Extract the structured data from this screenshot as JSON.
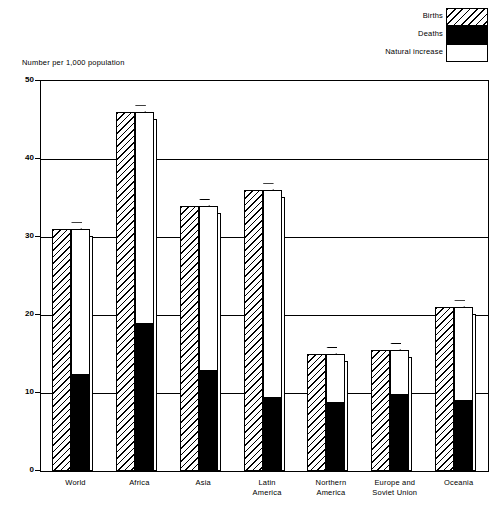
{
  "axis_title": "Number per 1,000 population",
  "legend": [
    {
      "label": "Births",
      "swatch": "hatched-diagonal"
    },
    {
      "label": "Deaths",
      "swatch": "solid-black"
    },
    {
      "label": "Natural increase",
      "swatch": "white"
    }
  ],
  "chart_data": {
    "type": "bar",
    "title": "",
    "subtitle": "",
    "xlabel": "",
    "ylabel": "Number per 1,000 population",
    "ylim": [
      0,
      50
    ],
    "yticks": [
      0,
      10,
      20,
      30,
      40,
      50
    ],
    "grid": true,
    "legend_position": "top-right",
    "categories": [
      "World",
      "Africa",
      "Asia",
      "Latin\nAmerica",
      "Northern\nAmerica",
      "Europe and\nSoviet Union",
      "Oceania"
    ],
    "series": [
      {
        "name": "Births",
        "values": [
          31,
          46,
          34,
          36,
          15,
          15.5,
          21
        ]
      },
      {
        "name": "Deaths",
        "values": [
          12.3,
          18.8,
          12.8,
          9.3,
          8.7,
          9.8,
          9.0
        ]
      },
      {
        "name": "Natural increase",
        "values": [
          18.7,
          27.2,
          21.2,
          26.7,
          6.3,
          5.7,
          12.0
        ]
      }
    ]
  }
}
